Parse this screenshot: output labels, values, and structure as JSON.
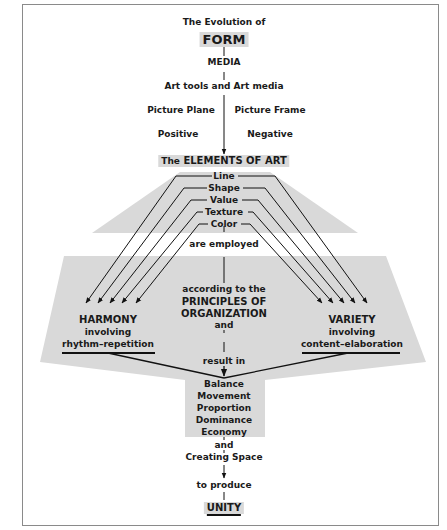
{
  "diagram": {
    "title_prefix": "The Evolution of",
    "title_main": "FORM",
    "media": "MEDIA",
    "art_tools": "Art tools and Art media",
    "picture_plane": "Picture Plane",
    "picture_frame": "Picture Frame",
    "positive": "Positive",
    "negative": "Negative",
    "elements_prefix": "The",
    "elements_main": "ELEMENTS OF ART",
    "elements": [
      "Line",
      "Shape",
      "Value",
      "Texture",
      "Color"
    ],
    "are_employed": "are employed",
    "according_to": "according to the",
    "principles_line1": "PRINCIPLES OF",
    "principles_line2": "ORGANIZATION",
    "and_1": "and",
    "harmony": {
      "title": "HARMONY",
      "involving": "involving",
      "detail": "rhythm–repetition"
    },
    "variety": {
      "title": "VARIETY",
      "involving": "involving",
      "detail": "content–elaboration"
    },
    "result_in": "result in",
    "principles": [
      "Balance",
      "Movement",
      "Proportion",
      "Dominance",
      "Economy"
    ],
    "and_2": "and",
    "creating_space": "Creating Space",
    "to_produce": "to produce",
    "unity": "UNITY"
  },
  "colors": {
    "shade": "#d9d9d9",
    "line": "#111111",
    "frame": "#8a8a8a"
  }
}
